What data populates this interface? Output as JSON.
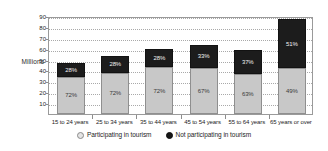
{
  "chart_data": {
    "type": "bar",
    "subtype": "stacked-bar",
    "title": "",
    "xlabel": "",
    "ylabel": "Millions",
    "ylim": [
      0,
      90
    ],
    "yticks": [
      90,
      80,
      70,
      60,
      50,
      40,
      30,
      20,
      10
    ],
    "grid": true,
    "legend_position": "bottom",
    "categories": [
      "15 to 24 years",
      "25 to 34 years",
      "35 to 44 years",
      "45 to 54 years",
      "55 to 64 years",
      "65 years or over"
    ],
    "series": [
      {
        "name": "Participating in tourism",
        "color": "#c8c8c8",
        "values": [
          34,
          38,
          43,
          42.5,
          36.5,
          42.5
        ],
        "labels": [
          "72%",
          "72%",
          "72%",
          "67%",
          "63%",
          "49%"
        ]
      },
      {
        "name": "Not participating in tourism",
        "color": "#1c1c1c",
        "values": [
          13,
          15,
          17,
          21,
          22,
          44.5
        ],
        "labels": [
          "28%",
          "28%",
          "28%",
          "33%",
          "37%",
          "51%"
        ]
      }
    ],
    "totals": [
      47,
      53,
      60,
      63.5,
      58.5,
      87
    ]
  },
  "axis": {
    "y_title": "Millions"
  },
  "legend": {
    "items": [
      {
        "label": "Participating in tourism",
        "marker": "circle-open-light-icon"
      },
      {
        "label": "Not participating in tourism",
        "marker": "circle-filled-dark-icon"
      }
    ]
  },
  "colors": {
    "participating": "#c8c8c8",
    "not_participating": "#1c1c1c",
    "gridline": "#a9a9a9",
    "frame": "#9a9a9a",
    "text": "#1d1d1d"
  }
}
